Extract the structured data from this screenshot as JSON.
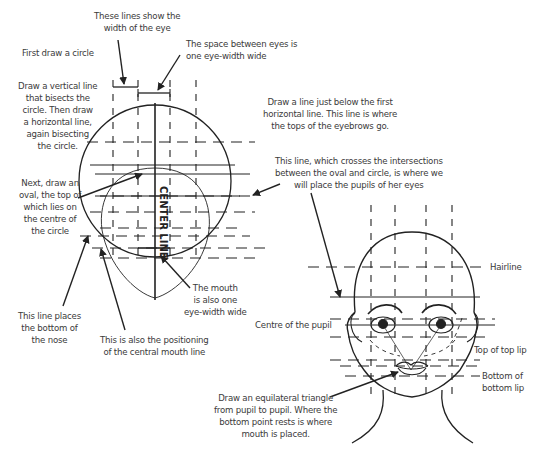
{
  "diagram": {
    "stroke_color": "#222222",
    "text_color": "#3a3a3a",
    "center_line_label": "CENTER LINE",
    "labels": {
      "eye_width_lines": "These lines show the\nwidth of the eye",
      "first_circle": "First draw a circle",
      "space_between_eyes": "The space between eyes is\none eye-width wide",
      "vertical_line": "Draw a vertical line\nthat bisects the\ncircle. Then draw\na horizontal line,\nagain bisecting\nthe circle.",
      "eyebrow_line": "Draw a line just below the first\nhorizontal line. This line is where\nthe tops of the eyebrows go.",
      "pupil_line": "This line, which crosses the intersections\nbetween the oval and circle, is where we\nwill place the pupils of her eyes",
      "oval": "Next, draw an\noval, the top of\nwhich lies on\nthe centre of\nthe circle",
      "mouth_width": "The mouth\nis also one\neye-width wide",
      "nose_bottom": "This line places\nthe bottom of\nthe nose",
      "mouth_line": "This is also the positioning\nof the central mouth line",
      "hairline": "Hairline",
      "centre_pupil": "Centre of the pupil",
      "top_lip": "Top of top lip",
      "bottom_lip": "Bottom of\nbottom lip",
      "triangle": "Draw an equilateral triangle\nfrom pupil to pupil. Where the\nbottom point rests is where\nmouth is placed."
    }
  }
}
